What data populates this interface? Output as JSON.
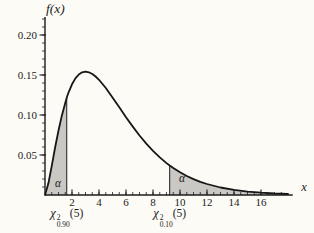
{
  "figure": {
    "background": "#fcfbf6",
    "curve_color": "#161616",
    "axis_color": "#1c1c1c",
    "fill_color": "#c9c8c4",
    "text_color": "#1b1b1b"
  },
  "chart_data": {
    "type": "area",
    "ylabel": "f(x)",
    "xlabel": "x",
    "xlim": [
      0,
      18.35
    ],
    "ylim": [
      0,
      0.2225
    ],
    "x_major_ticks": [
      2,
      4,
      6,
      8,
      10,
      12,
      14,
      16
    ],
    "x_minor_step": 0.5,
    "x_minor_count": 35,
    "y_major_ticks": [
      {
        "v": 0.05,
        "label": "0.05"
      },
      {
        "v": 0.1,
        "label": "0.10"
      },
      {
        "v": 0.15,
        "label": "0.15"
      },
      {
        "v": 0.2,
        "label": "0.20"
      }
    ],
    "y_minor_step": 0.01,
    "y_minor_count": 22,
    "critical_values": {
      "lower": 1.61,
      "upper": 9.236
    },
    "shaded_regions": [
      {
        "from": 0,
        "to": 1.61,
        "label": "α"
      },
      {
        "from": 9.236,
        "to": 18,
        "label": "α"
      }
    ],
    "alpha_labels": [
      {
        "text": "α",
        "x": 0.96,
        "y": 0.015
      },
      {
        "text": "α",
        "x": 10.15,
        "y": 0.0213
      }
    ],
    "x_axis_annotations": [
      {
        "chi": "χ",
        "sup": "2",
        "sub": "0.90",
        "arg": "(5)",
        "x_data": 1.61
      },
      {
        "chi": "χ",
        "sup": "2",
        "sub": "0.10",
        "arg": "(5)",
        "x_data": 9.236
      }
    ],
    "curve": [
      [
        0,
        0
      ],
      [
        0.25,
        0.01467
      ],
      [
        0.5,
        0.03662
      ],
      [
        0.75,
        0.05937
      ],
      [
        1,
        0.08066
      ],
      [
        1.25,
        0.09948
      ],
      [
        1.5,
        0.1154
      ],
      [
        1.61,
        0.12146
      ],
      [
        1.75,
        0.12834
      ],
      [
        2,
        0.13837
      ],
      [
        2.25,
        0.14571
      ],
      [
        2.5,
        0.15061
      ],
      [
        2.75,
        0.15334
      ],
      [
        3,
        0.15419
      ],
      [
        3.25,
        0.15339
      ],
      [
        3.5,
        0.15131
      ],
      [
        3.75,
        0.14809
      ],
      [
        4,
        0.14398
      ],
      [
        4.5,
        0.1338
      ],
      [
        5,
        0.12204
      ],
      [
        5.5,
        0.10966
      ],
      [
        6,
        0.09731
      ],
      [
        6.5,
        0.08545
      ],
      [
        7,
        0.07437
      ],
      [
        7.5,
        0.06424
      ],
      [
        8,
        0.05511
      ],
      [
        8.5,
        0.04701
      ],
      [
        9,
        0.03989
      ],
      [
        9.236,
        0.03685
      ],
      [
        9.5,
        0.03369
      ],
      [
        10,
        0.02834
      ],
      [
        10.5,
        0.02374
      ],
      [
        11,
        0.01983
      ],
      [
        11.5,
        0.01651
      ],
      [
        12,
        0.0137
      ],
      [
        13,
        0.00937
      ],
      [
        14,
        0.00635
      ],
      [
        15,
        0.00427
      ],
      [
        16,
        0.00286
      ],
      [
        17,
        0.0019
      ],
      [
        18,
        0.00125
      ]
    ]
  }
}
